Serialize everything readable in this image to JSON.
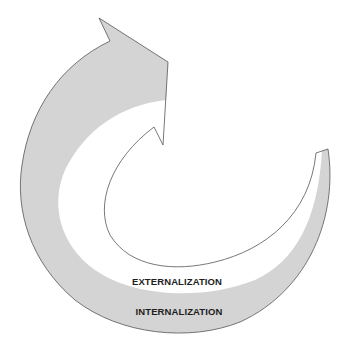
{
  "diagram": {
    "type": "spiral-arrow",
    "labels": {
      "externalization": "EXTERNALIZATION",
      "internalization": "INTERNALIZATION"
    },
    "colors": {
      "band_fill": "#d4d4d4",
      "outline": "#555555",
      "text": "#1e1e1e",
      "background": "#ffffff"
    }
  }
}
